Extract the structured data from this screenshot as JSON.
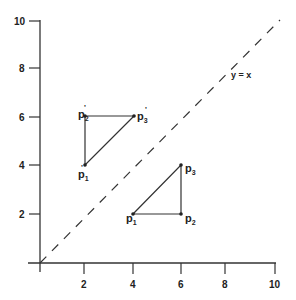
{
  "diagram": {
    "type": "coordinate-reflection",
    "axes": {
      "x_ticks": [
        "2",
        "4",
        "6",
        "8",
        "10"
      ],
      "y_ticks": [
        "2",
        "4",
        "6",
        "8",
        "10"
      ],
      "range": [
        0,
        10
      ]
    },
    "line": {
      "label": "y = x",
      "style": "dashed"
    },
    "triangle_original": {
      "points": [
        {
          "name": "p",
          "sub": "1",
          "prime": "",
          "x": 4,
          "y": 2
        },
        {
          "name": "p",
          "sub": "2",
          "prime": "",
          "x": 6,
          "y": 2
        },
        {
          "name": "p",
          "sub": "3",
          "prime": "",
          "x": 6,
          "y": 4
        }
      ]
    },
    "triangle_reflected": {
      "points": [
        {
          "name": "p",
          "sub": "1",
          "prime": "'",
          "x": 2,
          "y": 4
        },
        {
          "name": "p",
          "sub": "2",
          "prime": "'",
          "x": 2,
          "y": 6
        },
        {
          "name": "p",
          "sub": "3",
          "prime": "'",
          "x": 4,
          "y": 6
        }
      ]
    }
  },
  "labels": {
    "x2": "2",
    "x4": "4",
    "x6": "6",
    "x8": "8",
    "x10": "10",
    "y2": "2",
    "y4": "4",
    "y6": "6",
    "y8": "8",
    "y10": "10",
    "line_label": "y = x",
    "p": "p",
    "s1": "1",
    "s2": "2",
    "s3": "3",
    "prime": "'"
  }
}
